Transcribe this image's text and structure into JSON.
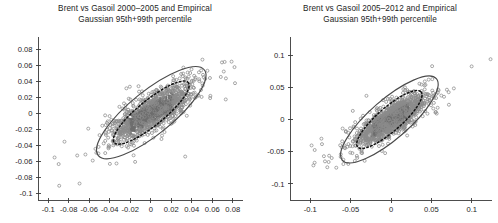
{
  "figure": {
    "background": "#ffffff",
    "width": 498,
    "height": 223
  },
  "chart_data": [
    {
      "type": "scatter",
      "panel": "left",
      "title": "Brent vs Gasoil 2000–2005 and Empirical\nGaussian 95th+99th percentile",
      "xlabel": "",
      "ylabel": "",
      "xlim": [
        -0.11,
        0.09
      ],
      "ylim": [
        -0.108,
        0.095
      ],
      "xticks": [
        -0.1,
        -0.08,
        -0.06,
        -0.04,
        -0.02,
        0,
        0.02,
        0.04,
        0.06,
        0.08
      ],
      "xticklabels": [
        "-0.1",
        "-0.08",
        "-0.06",
        "-0.04",
        "-0.02",
        "0",
        "0.02",
        "0.04",
        "0.06",
        "0.08"
      ],
      "yticks": [
        0.08,
        0.06,
        0.04,
        0.02,
        0,
        -0.02,
        -0.04,
        -0.06,
        -0.08,
        -0.1
      ],
      "yticklabels": [
        "0.08",
        "0.06",
        "0.04",
        "0.02",
        "0",
        "-0.02",
        "-0.04",
        "-0.06",
        "-0.08",
        "-0.1"
      ],
      "grid": false,
      "legend": "none",
      "marker": "open-circle",
      "point_count": 1400,
      "cloud": {
        "center_x": 0.0005,
        "center_y": 0.0005,
        "sigma_x": 0.0175,
        "sigma_y": 0.0155,
        "correlation": 0.78
      },
      "ellipses": [
        {
          "name": "empirical-95th-percentile",
          "style": "dashed",
          "color": "#111111",
          "center_x": 0.0005,
          "center_y": 0.0008,
          "semi_major": 0.0465,
          "semi_minor": 0.0158,
          "angle_deg": 39
        },
        {
          "name": "gaussian-99th-percentile",
          "style": "solid",
          "color": "#4a4a4a",
          "center_x": 0.0005,
          "center_y": 0.0008,
          "semi_major": 0.0665,
          "semi_minor": 0.0268,
          "angle_deg": 39
        }
      ]
    },
    {
      "type": "scatter",
      "panel": "right",
      "title": "Brent vs Gasoil 2005–2012 and Empirical\nGaussian 95th+99th percentile",
      "xlabel": "",
      "ylabel": "",
      "xlim": [
        -0.125,
        0.125
      ],
      "ylim": [
        -0.125,
        0.128
      ],
      "xticks": [
        -0.1,
        -0.05,
        0,
        0.05,
        0.1
      ],
      "xticklabels": [
        "-0.1",
        "-0.05",
        "0",
        "0.05",
        "0.1"
      ],
      "yticks": [
        0.1,
        0.05,
        0,
        -0.05,
        -0.1
      ],
      "yticklabels": [
        "0.1",
        "0.05",
        "0",
        "-0.05",
        "-0.1"
      ],
      "grid": false,
      "legend": "none",
      "marker": "open-circle",
      "point_count": 1600,
      "cloud": {
        "center_x": 0.0,
        "center_y": 0.0,
        "sigma_x": 0.019,
        "sigma_y": 0.017,
        "correlation": 0.8
      },
      "ellipses": [
        {
          "name": "empirical-95th-percentile",
          "style": "dashed",
          "color": "#111111",
          "center_x": -0.002,
          "center_y": 0.0,
          "semi_major": 0.052,
          "semi_minor": 0.0185,
          "angle_deg": 41
        },
        {
          "name": "gaussian-99th-percentile",
          "style": "solid",
          "color": "#4a4a4a",
          "center_x": -0.002,
          "center_y": 0.0,
          "semi_major": 0.077,
          "semi_minor": 0.0305,
          "angle_deg": 41
        }
      ]
    }
  ]
}
